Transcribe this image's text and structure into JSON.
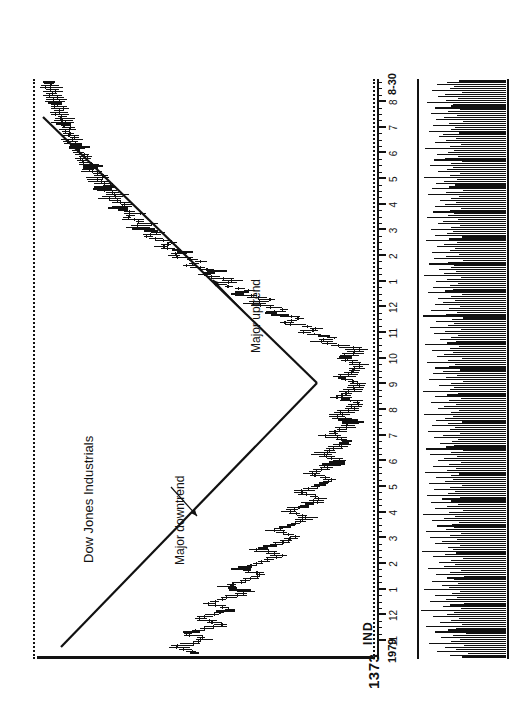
{
  "chart_data": {
    "type": "line",
    "title": "Dow Jones Industrials",
    "pane_tag": "IND",
    "xlabel": "",
    "ylabel": "",
    "price_axis_label": "1373",
    "start_date_label": "1979",
    "start_day_label": "9-28",
    "end_date_label": "8-30",
    "end_year_label": "88",
    "grid": false,
    "legend": "none",
    "month_ticks": [
      "11",
      "12",
      "1",
      "2",
      "3",
      "4",
      "5",
      "6",
      "7",
      "8",
      "9",
      "10",
      "11",
      "12",
      "1",
      "2",
      "3",
      "4",
      "5",
      "6",
      "7",
      "8"
    ],
    "annotations": [
      {
        "text": "Major downtrend",
        "kind": "trendline-label"
      },
      {
        "text": "Major uptrend",
        "kind": "trendline-label"
      }
    ],
    "trendlines": [
      {
        "name": "Major downtrend",
        "x1": 36,
        "y1": 40,
        "x2": 300,
        "y2": 296
      },
      {
        "name": "Major uptrend",
        "x1": 300,
        "y1": 296,
        "x2": 566,
        "y2": 22
      }
    ],
    "price_series_name": "Dow Jones Industrials",
    "price_values": [
      168,
      171,
      176,
      181,
      178,
      172,
      166,
      160,
      163,
      169,
      174,
      171,
      165,
      158,
      151,
      147,
      152,
      158,
      163,
      160,
      154,
      148,
      143,
      139,
      144,
      150,
      156,
      152,
      146,
      140,
      134,
      130,
      126,
      131,
      137,
      142,
      138,
      132,
      127,
      122,
      118,
      114,
      119,
      125,
      130,
      127,
      121,
      116,
      111,
      107,
      103,
      99,
      104,
      110,
      115,
      112,
      106,
      101,
      97,
      93,
      89,
      86,
      91,
      97,
      102,
      99,
      94,
      89,
      85,
      81,
      78,
      75,
      80,
      86,
      91,
      88,
      83,
      78,
      74,
      71,
      68,
      65,
      70,
      76,
      81,
      78,
      73,
      69,
      65,
      62,
      59,
      57,
      61,
      67,
      72,
      69,
      64,
      60,
      57,
      54,
      51,
      49,
      53,
      59,
      64,
      61,
      57,
      53,
      50,
      47,
      45,
      43,
      47,
      52,
      57,
      54,
      50,
      47,
      44,
      42,
      40,
      38,
      42,
      47,
      51,
      49,
      45,
      42,
      39,
      37,
      36,
      35,
      39,
      44,
      48,
      46,
      43,
      40,
      38,
      36,
      35,
      34,
      38,
      43,
      47,
      45,
      42,
      39,
      37,
      35,
      34,
      33,
      36,
      41,
      45,
      44,
      41,
      38,
      36,
      35,
      40,
      48,
      57,
      64,
      60,
      55,
      62,
      70,
      78,
      74,
      68,
      76,
      85,
      92,
      88,
      82,
      90,
      98,
      105,
      101,
      95,
      103,
      112,
      119,
      115,
      109,
      117,
      126,
      133,
      129,
      123,
      131,
      140,
      147,
      143,
      137,
      145,
      153,
      160,
      156,
      150,
      158,
      166,
      173,
      169,
      163,
      170,
      178,
      185,
      181,
      176,
      183,
      190,
      196,
      192,
      187,
      194,
      200,
      206,
      203,
      198,
      204,
      210,
      215,
      212,
      207,
      213,
      219,
      224,
      221,
      217,
      222,
      227,
      231,
      228,
      224,
      229,
      234,
      238,
      236,
      232,
      236,
      240,
      244,
      242,
      239,
      243,
      247,
      250,
      248,
      245,
      249,
      253,
      256,
      254,
      252,
      255,
      258,
      261,
      260,
      258,
      261,
      264,
      266,
      265,
      263,
      266,
      268,
      270,
      269,
      267,
      270,
      272,
      274,
      273,
      272,
      274,
      276,
      277,
      276,
      275,
      277,
      279,
      280,
      280,
      279,
      280,
      282,
      283,
      283,
      282,
      283,
      285,
      286,
      285,
      285,
      286,
      287,
      288,
      288
    ],
    "price_axis_range_note": "price pane top = dotted rule, bottom = dotted rule",
    "volume_series_name": "Volume",
    "volume_values": [
      46,
      58,
      39,
      71,
      52,
      63,
      44,
      80,
      57,
      48,
      67,
      55,
      41,
      74,
      60,
      52,
      83,
      46,
      68,
      57,
      49,
      76,
      61,
      54,
      88,
      47,
      65,
      58,
      44,
      79,
      62,
      51,
      73,
      56,
      48,
      85,
      59,
      66,
      50,
      77,
      54,
      61,
      43,
      72,
      58,
      47,
      81,
      64,
      53,
      69,
      57,
      45,
      76,
      63,
      52,
      87,
      55,
      60,
      48,
      74,
      66,
      51,
      79,
      58,
      47,
      83,
      62,
      54,
      71,
      56,
      49,
      77,
      64,
      53,
      86,
      59,
      45,
      73,
      61,
      50,
      78,
      57,
      66,
      48,
      82,
      60,
      53,
      75,
      58,
      46,
      80,
      63,
      55,
      72,
      57,
      49,
      84,
      61,
      52,
      76,
      59,
      47,
      70,
      64,
      51,
      79,
      57,
      45,
      83,
      62,
      54,
      68,
      56,
      50,
      75,
      65,
      48,
      81,
      58,
      53,
      77,
      60,
      46,
      72,
      63,
      55,
      85,
      57,
      49,
      70,
      64,
      52,
      78,
      59,
      47,
      74,
      61,
      50,
      86,
      58,
      54,
      69,
      57,
      45,
      80,
      62,
      51,
      76,
      65,
      48,
      73,
      59,
      53,
      82,
      60,
      46,
      71,
      64,
      55,
      77,
      58,
      49,
      84,
      61,
      52,
      68,
      57,
      50,
      75,
      63,
      47,
      79,
      60,
      54,
      72,
      56,
      45,
      86,
      62,
      51,
      78,
      59,
      48,
      74,
      65,
      53,
      70,
      57,
      46,
      81,
      63,
      55,
      76,
      58,
      50,
      72,
      61,
      47,
      85,
      64,
      52,
      69,
      57,
      54,
      80,
      60,
      45,
      75,
      62,
      49,
      77,
      58,
      53,
      71,
      64,
      51,
      83,
      59,
      46,
      73,
      61,
      55,
      78,
      57,
      48,
      70,
      65,
      50,
      82,
      60,
      54,
      76,
      58,
      47,
      74,
      63,
      52,
      68,
      57,
      49,
      81,
      62,
      45,
      77,
      59,
      53,
      72,
      64,
      51,
      85,
      58,
      48,
      70,
      61,
      55,
      79,
      57,
      46,
      75,
      63,
      50,
      71,
      60,
      54,
      84,
      58,
      47,
      73,
      62,
      52,
      69,
      65,
      49,
      80,
      57,
      53,
      76,
      59,
      45,
      72,
      64,
      51,
      78,
      60,
      48,
      74,
      57,
      55,
      82,
      62,
      50,
      70,
      63,
      46,
      77,
      58,
      54,
      71,
      61,
      49
    ]
  },
  "page": {
    "background": "#ffffff",
    "ink": "#111111"
  }
}
